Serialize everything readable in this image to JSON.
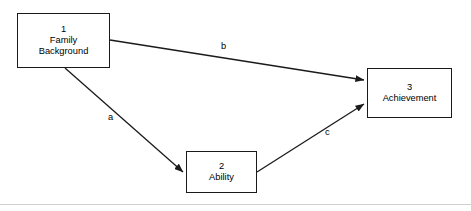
{
  "diagram": {
    "type": "path-diagram",
    "title": "",
    "background_color": "#ffffff",
    "line_color": "#1a1a1a",
    "text_color": "#000000",
    "nodes": [
      {
        "id": "family-background",
        "number": "1",
        "label": "Family\nBackground",
        "x": 17,
        "y": 13,
        "width": 93,
        "height": 55
      },
      {
        "id": "ability",
        "number": "2",
        "label": "Ability",
        "x": 186,
        "y": 151,
        "width": 71,
        "height": 42
      },
      {
        "id": "achievement",
        "number": "3",
        "label": "Achievement",
        "x": 367,
        "y": 68,
        "width": 85,
        "height": 50
      }
    ],
    "edges": [
      {
        "id": "edge-b",
        "label": "b",
        "from": "family-background",
        "to": "achievement",
        "x1": 110,
        "y1": 40,
        "x2": 364,
        "y2": 80,
        "label_x": 221,
        "label_y": 42
      },
      {
        "id": "edge-a",
        "label": "a",
        "from": "family-background",
        "to": "ability",
        "x1": 65,
        "y1": 68,
        "x2": 183,
        "y2": 172,
        "label_x": 108,
        "label_y": 113
      },
      {
        "id": "edge-c",
        "label": "c",
        "from": "ability",
        "to": "achievement",
        "x1": 257,
        "y1": 172,
        "x2": 364,
        "y2": 104,
        "label_x": 325,
        "label_y": 128
      }
    ],
    "footer_rule": {
      "visible": true,
      "color": "#cfcfcf"
    }
  }
}
